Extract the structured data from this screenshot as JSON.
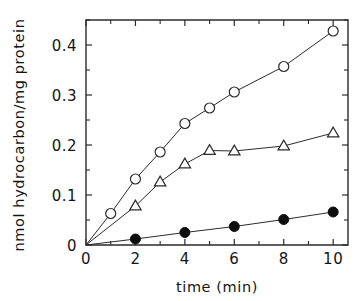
{
  "chart_data": {
    "type": "line",
    "title": "",
    "subtitle": "",
    "xlabel": "time (min)",
    "ylabel": "nmol hydrocarbon/mg protein",
    "xlim": [
      0,
      10.6
    ],
    "ylim": [
      0,
      0.45
    ],
    "xticks": [
      0,
      2,
      4,
      6,
      8,
      10
    ],
    "xtick_labels": [
      "0",
      "2",
      "4",
      "6",
      "8",
      "10"
    ],
    "yticks": [
      0,
      0.1,
      0.2,
      0.3,
      0.4
    ],
    "ytick_labels": [
      "0",
      "0.1",
      "0.2",
      "0.3",
      "0.4"
    ],
    "x_minor_ticks": [
      1,
      3,
      5,
      7,
      9
    ],
    "y_minor_ticks": [
      0.05,
      0.15,
      0.25,
      0.35,
      0.45
    ],
    "grid": false,
    "legend": "none",
    "frame": "box",
    "ticks_inside": true,
    "series": [
      {
        "name": "open-circle-series",
        "marker": "open-circle",
        "color": "#2b2b2b",
        "x": [
          0,
          1,
          2,
          3,
          4,
          5,
          6,
          8,
          10
        ],
        "values": [
          0.0,
          0.063,
          0.132,
          0.186,
          0.243,
          0.274,
          0.306,
          0.357,
          0.428
        ]
      },
      {
        "name": "open-triangle-series",
        "marker": "open-triangle",
        "color": "#2b2b2b",
        "x": [
          0,
          2,
          3,
          4,
          5,
          6,
          8,
          10
        ],
        "values": [
          0.0,
          0.078,
          0.126,
          0.162,
          0.189,
          0.188,
          0.198,
          0.224
        ]
      },
      {
        "name": "filled-circle-series",
        "marker": "filled-circle",
        "color": "#0d0d0d",
        "x": [
          0,
          2,
          4,
          6,
          8,
          10
        ],
        "values": [
          0.0,
          0.012,
          0.025,
          0.037,
          0.051,
          0.066
        ]
      }
    ]
  }
}
